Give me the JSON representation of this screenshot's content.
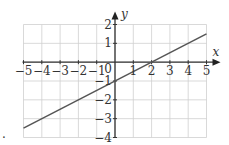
{
  "chart_data": {
    "type": "line",
    "title": "",
    "xlabel": "x",
    "ylabel": "y",
    "xlim": [
      -5,
      5
    ],
    "ylim": [
      -4,
      2
    ],
    "grid": true,
    "x_ticks": [
      "-5",
      "-4",
      "-3",
      "-2",
      "-1",
      "0",
      "1",
      "2",
      "3",
      "4",
      "5"
    ],
    "y_ticks": [
      "2",
      "1",
      "-1",
      "-2",
      "-3",
      "-4"
    ],
    "origin_label": "0",
    "series": [
      {
        "name": "y = 0.5x - 1",
        "x": [
          -5,
          5
        ],
        "y": [
          -3.5,
          1.5
        ],
        "color": "#555555"
      }
    ],
    "annotations": [
      {
        "text": ".",
        "position": "bottom-left"
      }
    ]
  },
  "labels": {
    "x_axis": "x",
    "y_axis": "y",
    "origin": "0",
    "corner_mark": "."
  }
}
